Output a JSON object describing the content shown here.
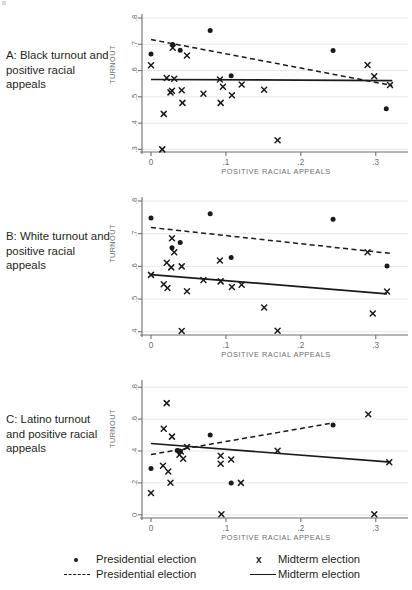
{
  "figure": {
    "xlabel": "POSITIVE RACIAL APPEALS",
    "ylabel": "TURNOUT"
  },
  "panels": [
    {
      "id": "A",
      "caption": "A: Black turnout and positive racial appeals",
      "ylabel": "TURNOUT",
      "xlabel": "POSITIVE RACIAL APPEALS"
    },
    {
      "id": "B",
      "caption": "B: White turnout and positive racial appeals",
      "ylabel": "TURNOUT",
      "xlabel": "POSITIVE RACIAL APPEALS"
    },
    {
      "id": "C",
      "caption": "C: Latino turnout and positive racial appeals",
      "ylabel": "TURNOUT",
      "xlabel": "POSITIVE RACIAL APPEALS"
    }
  ],
  "legend": {
    "entries": [
      {
        "key": "dot",
        "label": "Presidential election"
      },
      {
        "key": "x",
        "label": "Midterm election"
      },
      {
        "key": "dash",
        "label": "Presidential election"
      },
      {
        "key": "solid",
        "label": "Midterm election"
      }
    ]
  },
  "chart_data": [
    {
      "type": "scatter",
      "panel": "A",
      "title": "A: Black turnout and positive racial appeals",
      "xlabel": "POSITIVE RACIAL APPEALS",
      "ylabel": "TURNOUT",
      "xlim": [
        -0.012,
        0.335
      ],
      "ylim": [
        0.29,
        0.8
      ],
      "xticks": [
        0,
        0.1,
        0.2,
        0.3
      ],
      "xticklabels": [
        "0",
        ".1",
        ".2",
        ".3"
      ],
      "yticks": [
        0.3,
        0.4,
        0.5,
        0.6,
        0.7,
        0.8
      ],
      "yticklabels": [
        ".3",
        ".4",
        ".5",
        ".6",
        ".7",
        ".8"
      ],
      "grid": true,
      "legend_position": "below-figure",
      "series": [
        {
          "name": "Presidential election",
          "marker": "dot",
          "points": [
            [
              0.0,
              0.663
            ],
            [
              0.029,
              0.699
            ],
            [
              0.039,
              0.677
            ],
            [
              0.079,
              0.752
            ],
            [
              0.107,
              0.58
            ],
            [
              0.243,
              0.676
            ],
            [
              0.314,
              0.455
            ]
          ]
        },
        {
          "name": "Midterm election",
          "marker": "x",
          "points": [
            [
              0.0,
              0.62
            ],
            [
              0.015,
              0.3
            ],
            [
              0.017,
              0.435
            ],
            [
              0.021,
              0.572
            ],
            [
              0.026,
              0.517
            ],
            [
              0.028,
              0.523
            ],
            [
              0.029,
              0.687
            ],
            [
              0.031,
              0.569
            ],
            [
              0.041,
              0.525
            ],
            [
              0.042,
              0.477
            ],
            [
              0.048,
              0.657
            ],
            [
              0.07,
              0.512
            ],
            [
              0.092,
              0.566
            ],
            [
              0.093,
              0.477
            ],
            [
              0.096,
              0.538
            ],
            [
              0.108,
              0.506
            ],
            [
              0.121,
              0.547
            ],
            [
              0.151,
              0.527
            ],
            [
              0.169,
              0.335
            ],
            [
              0.289,
              0.621
            ],
            [
              0.298,
              0.578
            ],
            [
              0.319,
              0.545
            ]
          ]
        },
        {
          "name": "Presidential election fit",
          "marker": "dashed-line",
          "line": [
            [
              0.0,
              0.718
            ],
            [
              0.322,
              0.543
            ]
          ]
        },
        {
          "name": "Midterm election fit",
          "marker": "solid-line",
          "line": [
            [
              0.0,
              0.566
            ],
            [
              0.322,
              0.562
            ]
          ]
        }
      ]
    },
    {
      "type": "scatter",
      "panel": "B",
      "title": "B: White turnout and positive racial appeals",
      "xlabel": "POSITIVE RACIAL APPEALS",
      "ylabel": "TURNOUT",
      "xlim": [
        -0.012,
        0.335
      ],
      "ylim": [
        0.39,
        0.8
      ],
      "xticks": [
        0,
        0.1,
        0.2,
        0.3
      ],
      "xticklabels": [
        "0",
        ".1",
        ".2",
        ".3"
      ],
      "yticks": [
        0.4,
        0.5,
        0.6,
        0.7,
        0.8
      ],
      "yticklabels": [
        ".4",
        ".5",
        ".6",
        ".7",
        ".8"
      ],
      "grid": true,
      "legend_position": "below-figure",
      "series": [
        {
          "name": "Presidential election",
          "marker": "dot",
          "points": [
            [
              0.0,
              0.748
            ],
            [
              0.028,
              0.657
            ],
            [
              0.039,
              0.673
            ],
            [
              0.079,
              0.761
            ],
            [
              0.107,
              0.627
            ],
            [
              0.243,
              0.744
            ],
            [
              0.315,
              0.601
            ]
          ]
        },
        {
          "name": "Midterm election",
          "marker": "x",
          "points": [
            [
              0.0,
              0.574
            ],
            [
              0.017,
              0.545
            ],
            [
              0.021,
              0.611
            ],
            [
              0.022,
              0.534
            ],
            [
              0.027,
              0.597
            ],
            [
              0.028,
              0.686
            ],
            [
              0.031,
              0.643
            ],
            [
              0.041,
              0.6
            ],
            [
              0.041,
              0.402
            ],
            [
              0.048,
              0.524
            ],
            [
              0.07,
              0.558
            ],
            [
              0.092,
              0.618
            ],
            [
              0.093,
              0.554
            ],
            [
              0.108,
              0.537
            ],
            [
              0.121,
              0.544
            ],
            [
              0.151,
              0.474
            ],
            [
              0.169,
              0.403
            ],
            [
              0.289,
              0.643
            ],
            [
              0.296,
              0.456
            ],
            [
              0.315,
              0.523
            ]
          ]
        },
        {
          "name": "Presidential election fit",
          "marker": "dashed-line",
          "line": [
            [
              0.0,
              0.719
            ],
            [
              0.322,
              0.639
            ]
          ]
        },
        {
          "name": "Midterm election fit",
          "marker": "solid-line",
          "line": [
            [
              0.0,
              0.575
            ],
            [
              0.315,
              0.516
            ]
          ]
        }
      ]
    },
    {
      "type": "scatter",
      "panel": "C",
      "title": "C: Latino turnout and positive racial appeals",
      "xlabel": "POSITIVE RACIAL APPEALS",
      "ylabel": "TURNOUT",
      "xlim": [
        -0.012,
        0.335
      ],
      "ylim": [
        -0.02,
        0.82
      ],
      "xticks": [
        0,
        0.1,
        0.2,
        0.3
      ],
      "xticklabels": [
        "0",
        ".1",
        ".2",
        ".3"
      ],
      "yticks": [
        0,
        0.2,
        0.4,
        0.6,
        0.8
      ],
      "yticklabels": [
        "0",
        ".2",
        ".4",
        ".6",
        ".8"
      ],
      "grid": true,
      "legend_position": "below-figure",
      "series": [
        {
          "name": "Presidential election",
          "marker": "dot",
          "points": [
            [
              0.0,
              0.29
            ],
            [
              0.035,
              0.403
            ],
            [
              0.039,
              0.398
            ],
            [
              0.079,
              0.5
            ],
            [
              0.107,
              0.2
            ],
            [
              0.243,
              0.563
            ]
          ]
        },
        {
          "name": "Midterm election",
          "marker": "x",
          "points": [
            [
              0.0,
              0.137
            ],
            [
              0.016,
              0.308
            ],
            [
              0.017,
              0.54
            ],
            [
              0.021,
              0.7
            ],
            [
              0.023,
              0.272
            ],
            [
              0.026,
              0.201
            ],
            [
              0.028,
              0.49
            ],
            [
              0.038,
              0.377
            ],
            [
              0.04,
              0.397
            ],
            [
              0.043,
              0.352
            ],
            [
              0.048,
              0.425
            ],
            [
              0.093,
              0.37
            ],
            [
              0.093,
              0.32
            ],
            [
              0.094,
              0.003
            ],
            [
              0.107,
              0.347
            ],
            [
              0.12,
              0.2
            ],
            [
              0.169,
              0.401
            ],
            [
              0.29,
              0.63
            ],
            [
              0.298,
              0.003
            ],
            [
              0.318,
              0.33
            ]
          ]
        },
        {
          "name": "Presidential election fit",
          "marker": "dashed-line",
          "line": [
            [
              0.0,
              0.378
            ],
            [
              0.243,
              0.576
            ]
          ]
        },
        {
          "name": "Midterm election fit",
          "marker": "solid-line",
          "line": [
            [
              0.0,
              0.447
            ],
            [
              0.32,
              0.33
            ]
          ]
        }
      ]
    }
  ]
}
